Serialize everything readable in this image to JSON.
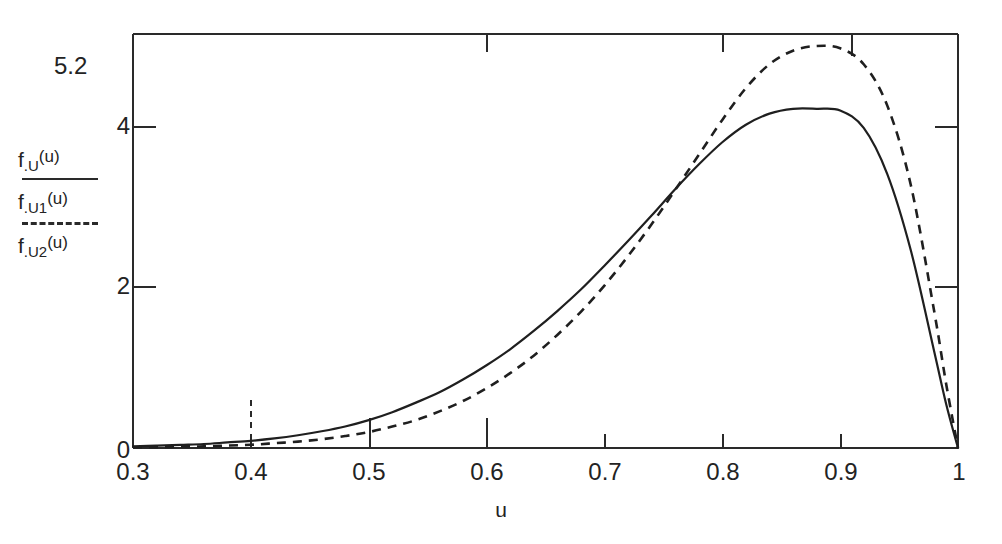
{
  "figure": {
    "title": "",
    "x_axis_label": "u",
    "legend": [
      {
        "name": "f.U(u)",
        "fn": "f",
        "sub": ".U",
        "arg": "(u)",
        "style": "solid"
      },
      {
        "name": "f.U1(u)",
        "fn": "f",
        "sub": ".U1",
        "arg": "(u)",
        "style": "dashed"
      },
      {
        "name": "f.U2(u)",
        "fn": "f",
        "sub": ".U2",
        "arg": "(u)",
        "style": "none"
      }
    ],
    "y_top_label": "5.2",
    "y_ticks": [
      "4",
      "2",
      "0"
    ],
    "x_ticks": [
      "0.3",
      "0.4",
      "0.5",
      "0.6",
      "0.7",
      "0.8",
      "0.9",
      "1"
    ],
    "colors": {
      "axis": "#2a2a2a",
      "curve_solid": "#1f1f1f",
      "curve_dashed": "#1f1f1f",
      "background": "#ffffff"
    }
  },
  "chart_data": {
    "type": "line",
    "title": "",
    "xlabel": "u",
    "ylabel": "f.U(u) / f.U1(u) / f.U2(u)",
    "xlim": [
      0.3,
      1.0
    ],
    "ylim": [
      0,
      5.2
    ],
    "grid": false,
    "legend_position": "left-outside",
    "xticks": [
      0.3,
      0.4,
      0.5,
      0.6,
      0.7,
      0.8,
      0.9,
      1.0
    ],
    "yticks": [
      0,
      2,
      4,
      5.2
    ],
    "annotations": [
      "solid curve peaks at approximately 4.26 near u = 0.90",
      "dashed curve peaks at approximately 5.05 near u = 0.91",
      "curves intersect near u = 0.82",
      "both densities vanish at u = 1"
    ],
    "x": [
      0.3,
      0.32,
      0.34,
      0.36,
      0.38,
      0.4,
      0.42,
      0.44,
      0.46,
      0.48,
      0.5,
      0.52,
      0.54,
      0.56,
      0.58,
      0.6,
      0.62,
      0.64,
      0.66,
      0.68,
      0.7,
      0.72,
      0.74,
      0.76,
      0.78,
      0.8,
      0.82,
      0.84,
      0.86,
      0.88,
      0.9,
      0.92,
      0.94,
      0.96,
      0.98,
      0.99,
      1.0
    ],
    "series": [
      {
        "name": "f.U1(u)",
        "style": "solid",
        "values": [
          0.02,
          0.03,
          0.04,
          0.05,
          0.07,
          0.09,
          0.12,
          0.16,
          0.21,
          0.27,
          0.35,
          0.45,
          0.57,
          0.7,
          0.86,
          1.04,
          1.24,
          1.47,
          1.72,
          1.99,
          2.29,
          2.6,
          2.92,
          3.25,
          3.56,
          3.84,
          4.06,
          4.2,
          4.26,
          4.26,
          4.24,
          4.02,
          3.44,
          2.48,
          1.2,
          0.55,
          0.0
        ]
      },
      {
        "name": "f.U2(u)",
        "style": "dashed",
        "values": [
          0.01,
          0.01,
          0.02,
          0.02,
          0.03,
          0.04,
          0.06,
          0.08,
          0.11,
          0.15,
          0.2,
          0.27,
          0.35,
          0.46,
          0.59,
          0.75,
          0.94,
          1.16,
          1.42,
          1.71,
          2.04,
          2.41,
          2.81,
          3.24,
          3.68,
          4.12,
          4.52,
          4.82,
          4.99,
          5.05,
          5.02,
          4.82,
          4.3,
          3.3,
          1.7,
          0.8,
          0.0
        ]
      }
    ]
  }
}
